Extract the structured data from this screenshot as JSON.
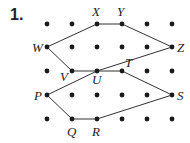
{
  "problem_number": "1.",
  "grid": {
    "columns_x": [
      47,
      72,
      97,
      122,
      147,
      172
    ],
    "rows_y": [
      24,
      47,
      71,
      95,
      119
    ],
    "dot_color": "#1a1a1a"
  },
  "points": [
    {
      "name": "X",
      "x": 97,
      "y": 24,
      "lx": 92,
      "ly": 16
    },
    {
      "name": "Y",
      "x": 122,
      "y": 24,
      "lx": 117,
      "ly": 16
    },
    {
      "name": "W",
      "x": 47,
      "y": 47,
      "lx": 32,
      "ly": 52
    },
    {
      "name": "Z",
      "x": 172,
      "y": 47,
      "lx": 177,
      "ly": 52
    },
    {
      "name": "V",
      "x": 72,
      "y": 71,
      "lx": 60,
      "ly": 81
    },
    {
      "name": "U",
      "x": 97,
      "y": 71,
      "lx": 92,
      "ly": 84
    },
    {
      "name": "T",
      "x": 122,
      "y": 71,
      "lx": 125,
      "ly": 67
    },
    {
      "name": "P",
      "x": 47,
      "y": 95,
      "lx": 34,
      "ly": 100
    },
    {
      "name": "S",
      "x": 172,
      "y": 95,
      "lx": 177,
      "ly": 100
    },
    {
      "name": "Q",
      "x": 72,
      "y": 119,
      "lx": 67,
      "ly": 136
    },
    {
      "name": "R",
      "x": 97,
      "y": 119,
      "lx": 92,
      "ly": 136
    }
  ],
  "segments": [
    [
      "W",
      "X"
    ],
    [
      "X",
      "Y"
    ],
    [
      "Y",
      "Z"
    ],
    [
      "W",
      "V"
    ],
    [
      "V",
      "U"
    ],
    [
      "U",
      "T"
    ],
    [
      "U",
      "Z"
    ],
    [
      "P",
      "U"
    ],
    [
      "P",
      "Q"
    ],
    [
      "Q",
      "R"
    ],
    [
      "R",
      "S"
    ],
    [
      "T",
      "S"
    ]
  ],
  "line_color": "#333333"
}
